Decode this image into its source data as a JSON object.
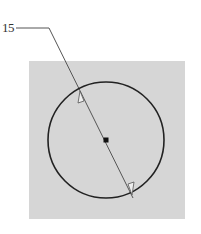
{
  "callout": {
    "label": "15"
  },
  "figure": {
    "background_color": "#d6d6d6",
    "circle_color": "#222222",
    "leader_color": "#555555"
  }
}
